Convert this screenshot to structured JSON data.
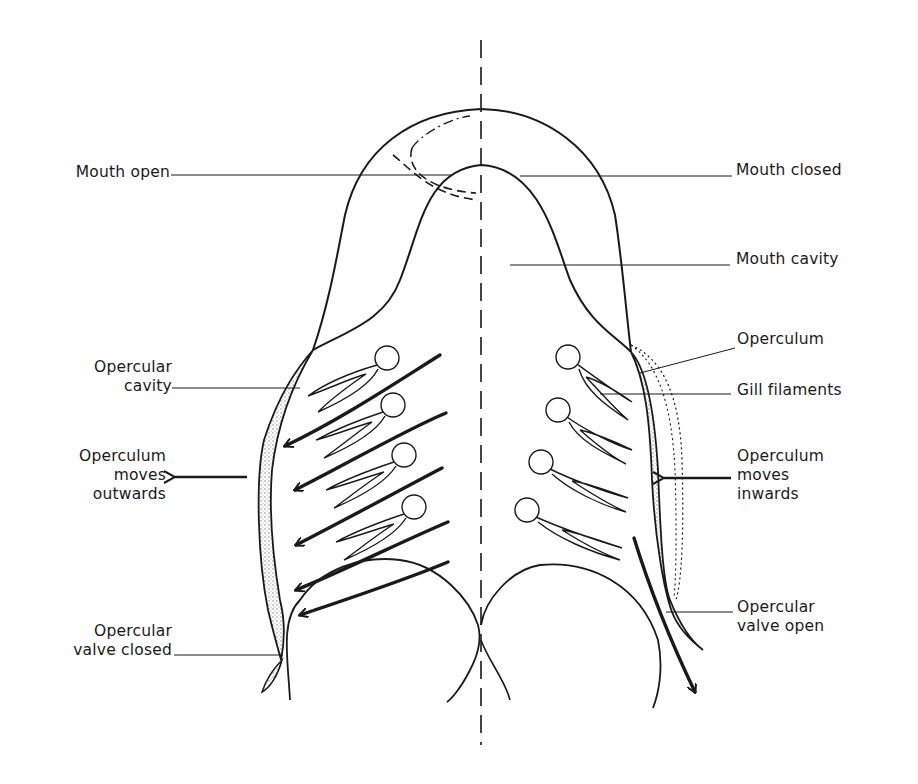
{
  "figure": {
    "left_half_phase": "Mouth open / operculum moves outwards",
    "right_half_phase": "Mouth closed / operculum moves inwards"
  },
  "labels": {
    "left": [
      {
        "id": "mouth-open",
        "lines": [
          "Mouth open"
        ]
      },
      {
        "id": "opercular-cavity",
        "lines": [
          "Opercular",
          "cavity"
        ]
      },
      {
        "id": "operculum-moves-outwards",
        "lines": [
          "Operculum",
          "moves",
          "outwards"
        ]
      },
      {
        "id": "opercular-valve-closed",
        "lines": [
          "Opercular",
          "valve closed"
        ]
      }
    ],
    "right": [
      {
        "id": "mouth-closed",
        "lines": [
          "Mouth closed"
        ]
      },
      {
        "id": "mouth-cavity",
        "lines": [
          "Mouth cavity"
        ]
      },
      {
        "id": "operculum",
        "lines": [
          "Operculum"
        ]
      },
      {
        "id": "gill-filaments",
        "lines": [
          "Gill filaments"
        ]
      },
      {
        "id": "operculum-moves-inwards",
        "lines": [
          "Operculum",
          "moves",
          "inwards"
        ]
      },
      {
        "id": "opercular-valve-open",
        "lines": [
          "Opercular",
          "valve open"
        ]
      }
    ]
  },
  "colors": {
    "ink": "#1a1a1a",
    "stipple": "#9a9a9a",
    "background": "#ffffff"
  }
}
